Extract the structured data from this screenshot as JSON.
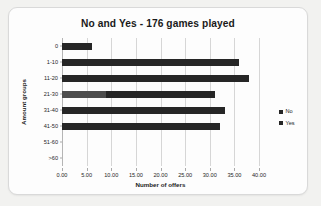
{
  "card": {
    "background_color": "#fdfdfd",
    "border_color": "#d9d9d9"
  },
  "chart_data": {
    "type": "bar",
    "orientation": "horizontal",
    "title": "No and Yes - 176 games played",
    "xlabel": "Number of offers",
    "ylabel": "Amount groups",
    "categories": [
      "0",
      "1-10",
      "11-20",
      "21-30",
      "31-40",
      "41-50",
      "51-60",
      ">60"
    ],
    "series": [
      {
        "name": "No",
        "color": "#262626",
        "values": [
          6,
          36,
          38,
          22,
          33,
          32,
          0,
          0
        ]
      },
      {
        "name": "Yes",
        "color": "#4d4d4d",
        "values": [
          0,
          0,
          0,
          9,
          0,
          0,
          0,
          0
        ]
      }
    ],
    "stacked": true,
    "totals": [
      6,
      36,
      38,
      31,
      33,
      32,
      0,
      0
    ],
    "xlim": [
      0,
      40
    ],
    "xticks": [
      0,
      5,
      10,
      15,
      20,
      25,
      30,
      35,
      40
    ],
    "xtick_labels": [
      "0.00",
      "5.00",
      "10.00",
      "15.00",
      "20.00",
      "25.00",
      "30.00",
      "35.00",
      "40.00"
    ],
    "grid": true,
    "grid_axis": "x",
    "legend_position": "right",
    "legend_entries": [
      "No",
      "Yes"
    ]
  }
}
